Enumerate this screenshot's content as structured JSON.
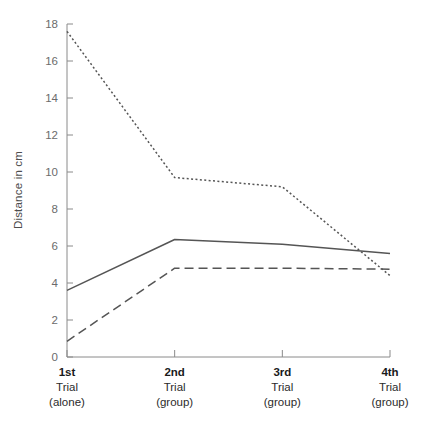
{
  "chart_data": {
    "type": "line",
    "title": "",
    "xlabel": "",
    "ylabel": "Distance in cm",
    "ylim": [
      0,
      18
    ],
    "yticks": [
      0,
      2,
      4,
      6,
      8,
      10,
      12,
      14,
      16,
      18
    ],
    "grid": false,
    "legend": "none",
    "categories": [
      "1st Trial (alone)",
      "2nd Trial (group)",
      "3rd Trial (group)",
      "4th Trial (group)"
    ],
    "category_lines": [
      [
        "1st",
        "Trial",
        "(alone)"
      ],
      [
        "2nd",
        "Trial",
        "(group)"
      ],
      [
        "3rd",
        "Trial",
        "(group)"
      ],
      [
        "4th",
        "Trial",
        "(group)"
      ]
    ],
    "series": [
      {
        "name": "dotted-series",
        "style": "dotted",
        "color": "#555555",
        "values": [
          17.6,
          9.7,
          9.2,
          4.4
        ]
      },
      {
        "name": "solid-series",
        "style": "solid",
        "color": "#555555",
        "values": [
          3.6,
          6.35,
          6.1,
          5.6
        ]
      },
      {
        "name": "dashed-series",
        "style": "dashed",
        "color": "#555555",
        "values": [
          0.85,
          4.8,
          4.8,
          4.75
        ]
      }
    ]
  },
  "axis": {
    "y_title": "Distance in cm",
    "tick_labels_y": [
      "0",
      "2",
      "4",
      "6",
      "8",
      "10",
      "12",
      "14",
      "16",
      "18"
    ]
  },
  "xaxis_labels": [
    {
      "l1": "1st",
      "l2": "Trial",
      "l3": "(alone)"
    },
    {
      "l1": "2nd",
      "l2": "Trial",
      "l3": "(group)"
    },
    {
      "l1": "3rd",
      "l2": "Trial",
      "l3": "(group)"
    },
    {
      "l1": "4th",
      "l2": "Trial",
      "l3": "(group)"
    }
  ],
  "colors": {
    "line": "#555555",
    "axis": "#8a8a8a",
    "tick_label": "#6b6b6b",
    "category_label": "#1a1a1a",
    "background": "#ffffff"
  }
}
